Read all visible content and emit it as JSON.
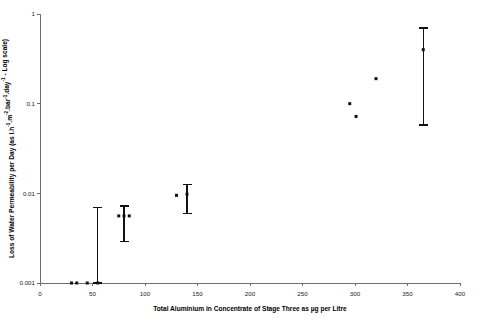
{
  "chart_data": {
    "type": "scatter",
    "title": "",
    "subtitle": "",
    "xlabel": "Total Aluminium in Concentrate of Stage Three as µg per Litre",
    "ylabel": "Loss of Water Permeability per Day (as l.h⁻¹.m⁻².bar⁻¹.day⁻¹ - Log scale)",
    "ylabel_parts": {
      "lead": "Loss of Water Permeability per Day (as l.h",
      "sup1": "-1",
      "mid1": ".m",
      "sup2": "-2",
      "mid2": ".bar",
      "sup3": "-1",
      "mid3": ".day",
      "sup4": "-1",
      "tail": " - Log scale)"
    },
    "xscale": "linear",
    "yscale": "log",
    "xlim": [
      0,
      400
    ],
    "ylim": [
      0.001,
      1
    ],
    "grid": false,
    "legend": null,
    "legend_position": "none",
    "xticks": [
      0,
      50,
      100,
      150,
      200,
      250,
      300,
      350,
      400
    ],
    "xtick_labels": [
      "0",
      "50",
      "100",
      "150",
      "200",
      "250",
      "300",
      "350",
      "400"
    ],
    "yticks": [
      0.001,
      0.01,
      0.1,
      1
    ],
    "ytick_labels": [
      "0.001",
      "0.01",
      "0.1",
      "1"
    ],
    "marker": "square",
    "marker_color": "#111111",
    "points": [
      {
        "x": 30,
        "y": 0.001
      },
      {
        "x": 35,
        "y": 0.001
      },
      {
        "x": 45,
        "y": 0.001
      },
      {
        "x": 55,
        "y": 0.001,
        "yerr_low": 0.001,
        "yerr_high": 0.007
      },
      {
        "x": 75,
        "y": 0.0056
      },
      {
        "x": 80,
        "y": 0.0056,
        "yerr_low": 0.0029,
        "yerr_high": 0.0072
      },
      {
        "x": 85,
        "y": 0.0056
      },
      {
        "x": 130,
        "y": 0.0095
      },
      {
        "x": 140,
        "y": 0.0098,
        "yerr_low": 0.006,
        "yerr_high": 0.0125
      },
      {
        "x": 295,
        "y": 0.1
      },
      {
        "x": 301,
        "y": 0.072
      },
      {
        "x": 320,
        "y": 0.19
      },
      {
        "x": 365,
        "y": 0.4,
        "yerr_low": 0.058,
        "yerr_high": 0.7
      }
    ],
    "colors": {
      "marker": "#111111",
      "error_bar": "#111111",
      "axis": "#6f6f6f",
      "text": "#1a1a1a",
      "background": "#ffffff"
    }
  }
}
